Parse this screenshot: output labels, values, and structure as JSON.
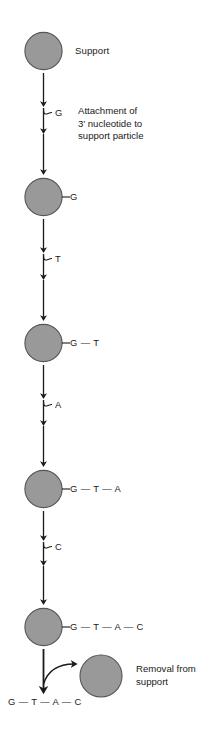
{
  "figure": {
    "title_visible": false,
    "background_color": "#ffffff",
    "support_particle": {
      "fill_color": "#999999",
      "stroke_color": "#555555",
      "icon": "gray-filled-circle"
    },
    "arrow_color": "#1a1a1a"
  },
  "steps": [
    {
      "id": "step-1",
      "particle_label": "Support",
      "chain": "",
      "added_base": "G",
      "annotation": [
        "Attachment of",
        "3’ nucleotide to",
        "support particle"
      ]
    },
    {
      "id": "step-2",
      "particle_label": "",
      "chain": "G",
      "added_base": "T",
      "annotation": []
    },
    {
      "id": "step-3",
      "particle_label": "",
      "chain": "G — T",
      "added_base": "A",
      "annotation": []
    },
    {
      "id": "step-4",
      "particle_label": "",
      "chain": "G — T — A",
      "added_base": "C",
      "annotation": []
    },
    {
      "id": "step-5",
      "particle_label": "",
      "chain": "G — T — A — C",
      "added_base": "",
      "annotation": []
    }
  ],
  "final_step": {
    "id": "step-removal",
    "released_chain": "G — T — A — C",
    "annotation": [
      "Removal from",
      "support"
    ],
    "released_particle_icon": "gray-filled-circle"
  },
  "bases_legend": {
    "G": "G",
    "T": "T",
    "A": "A",
    "C": "C"
  }
}
